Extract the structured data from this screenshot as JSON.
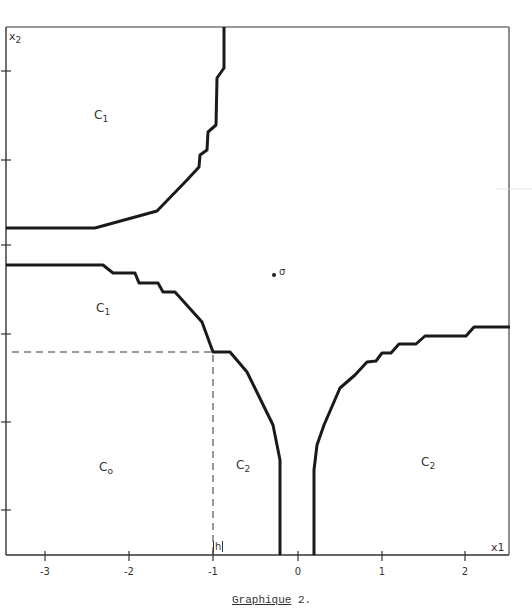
{
  "chart_data": {
    "type": "line",
    "title": "Graphique 2.",
    "xlabel": "x1",
    "ylabel": "x2",
    "xlim": [
      -3.46,
      2.5
    ],
    "x_ticks": [
      -3,
      -2,
      -1,
      0,
      1,
      2
    ],
    "x_tick_labels": [
      "-3",
      "-2",
      "-1",
      "0",
      "1",
      "2"
    ],
    "y_tick_count": 6,
    "grid": false,
    "legend": null,
    "annotations": [
      {
        "text": "σ",
        "type": "point",
        "x": -0.27,
        "note": "reference point"
      },
      {
        "text": "h",
        "type": "axis-marker",
        "x": -1.0
      },
      {
        "text": "C1",
        "region": "upper-left"
      },
      {
        "text": "C1",
        "region": "middle-left"
      },
      {
        "text": "Co",
        "region": "lower-left"
      },
      {
        "text": "C2",
        "region": "lower-middle"
      },
      {
        "text": "C2",
        "region": "lower-right"
      }
    ],
    "series": [
      {
        "name": "boundary-upper-C1",
        "style": "thick-solid",
        "points_px": [
          [
            6,
            228
          ],
          [
            95,
            228
          ],
          [
            157,
            211
          ],
          [
            187,
            180
          ],
          [
            199,
            167
          ],
          [
            200,
            155
          ],
          [
            207,
            150
          ],
          [
            208,
            132
          ],
          [
            216,
            125
          ],
          [
            217,
            78
          ],
          [
            224,
            68
          ],
          [
            224,
            27
          ]
        ]
      },
      {
        "name": "boundary-lower-C1",
        "style": "thick-solid",
        "points_px": [
          [
            6,
            265
          ],
          [
            103,
            265
          ],
          [
            113,
            273
          ],
          [
            135,
            273
          ],
          [
            139,
            283
          ],
          [
            158,
            283
          ],
          [
            163,
            292
          ],
          [
            175,
            292
          ],
          [
            202,
            322
          ],
          [
            213,
            352
          ],
          [
            230,
            352
          ],
          [
            247,
            372
          ],
          [
            273,
            425
          ],
          [
            280,
            460
          ],
          [
            280,
            555
          ]
        ]
      },
      {
        "name": "boundary-right-C2",
        "style": "thick-solid",
        "points_px": [
          [
            314,
            555
          ],
          [
            314,
            470
          ],
          [
            317,
            445
          ],
          [
            324,
            425
          ],
          [
            340,
            388
          ],
          [
            355,
            375
          ],
          [
            367,
            362
          ],
          [
            376,
            361
          ],
          [
            382,
            353
          ],
          [
            391,
            353
          ],
          [
            399,
            344
          ],
          [
            416,
            344
          ],
          [
            425,
            336
          ],
          [
            466,
            336
          ],
          [
            474,
            327
          ],
          [
            510,
            327
          ]
        ]
      },
      {
        "name": "h-projection",
        "style": "dashed",
        "points_px": [
          [
            12,
            352
          ],
          [
            213,
            352
          ],
          [
            213,
            555
          ]
        ]
      }
    ]
  },
  "axes": {
    "x_label": "x1",
    "y_label": "x2",
    "x_ticks": [
      {
        "label": "-3",
        "px": 45
      },
      {
        "label": "-2",
        "px": 129
      },
      {
        "label": "-1",
        "px": 213
      },
      {
        "label": "0",
        "px": 298
      },
      {
        "label": "1",
        "px": 382
      },
      {
        "label": "2",
        "px": 465
      }
    ],
    "y_ticks_px": [
      71,
      160,
      245,
      334,
      422,
      510
    ],
    "h_marker": "h"
  },
  "regions": [
    {
      "base": "C",
      "sub": "1",
      "x": 94,
      "y": 108
    },
    {
      "base": "C",
      "sub": "1",
      "x": 96,
      "y": 301
    },
    {
      "base": "C",
      "sub": "o",
      "x": 99,
      "y": 460
    },
    {
      "base": "C",
      "sub": "2",
      "x": 236,
      "y": 458
    },
    {
      "base": "C",
      "sub": "2",
      "x": 421,
      "y": 455
    }
  ],
  "point": {
    "label": "σ",
    "x": 274,
    "y": 275
  },
  "caption": {
    "main": "Graphique",
    "suffix": " 2."
  }
}
